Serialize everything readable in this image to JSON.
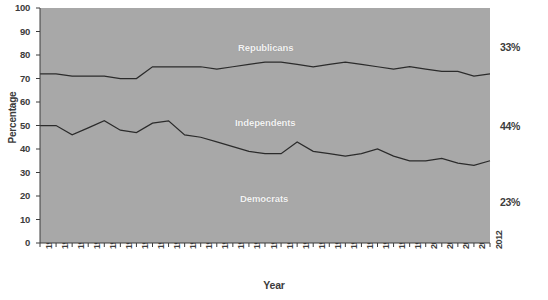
{
  "chart_data": {
    "type": "area",
    "title": "",
    "xlabel": "Year",
    "ylabel": "Percentage",
    "ylim": [
      0,
      100
    ],
    "yticks": [
      0,
      10,
      20,
      30,
      40,
      50,
      60,
      70,
      80,
      90,
      100
    ],
    "grid": false,
    "legend_position": "inline-bands",
    "stacked": true,
    "x": [
      1952,
      1954,
      1956,
      1958,
      1960,
      1962,
      1964,
      1966,
      1968,
      1970,
      1972,
      1974,
      1976,
      1978,
      1980,
      1982,
      1984,
      1986,
      1988,
      1990,
      1992,
      1994,
      1996,
      1998,
      2000,
      2002,
      2004,
      2008,
      2012
    ],
    "tick_labels": [
      "1952",
      "1954",
      "1956",
      "1958",
      "1960",
      "1962",
      "1964",
      "1966",
      "1968",
      "1970",
      "1972",
      "1974",
      "1976",
      "1978",
      "1980",
      "1982",
      "1984",
      "1986",
      "1988",
      "1990",
      "1992",
      "1994",
      "1996",
      "1998",
      "2000",
      "2002",
      "2004",
      "2008",
      "2012"
    ],
    "boundaries": {
      "democrats_top": {
        "name": "Democrats upper boundary (cumulative %)",
        "values": [
          50,
          50,
          46,
          49,
          52,
          48,
          47,
          51,
          52,
          46,
          45,
          43,
          41,
          39,
          38,
          38,
          43,
          39,
          38,
          37,
          38,
          40,
          37,
          35,
          35,
          36,
          34,
          33,
          35
        ]
      },
      "independents_top": {
        "name": "Democrats + Independents (cumulative %)",
        "values": [
          72,
          72,
          71,
          71,
          71,
          70,
          70,
          75,
          75,
          75,
          75,
          74,
          75,
          76,
          77,
          77,
          76,
          75,
          76,
          77,
          76,
          75,
          74,
          75,
          74,
          73,
          73,
          71,
          72
        ]
      }
    },
    "series": [
      {
        "name": "Democrats",
        "label": "Democrats",
        "color": "#a8a8a8",
        "end_value_label": "23%"
      },
      {
        "name": "Independents",
        "label": "Independents",
        "color": "#a8a8a8",
        "end_value_label": "44%"
      },
      {
        "name": "Republicans",
        "label": "Republicans",
        "color": "#a8a8a8",
        "end_value_label": "33%"
      }
    ],
    "band_labels": [
      {
        "text": "Republicans",
        "left": 238,
        "top": 42
      },
      {
        "text": "Independents",
        "left": 235,
        "top": 117
      },
      {
        "text": "Democrats",
        "left": 240,
        "top": 193
      }
    ],
    "right_annotations": [
      {
        "text": "33%",
        "top": 41
      },
      {
        "text": "44%",
        "top": 120
      },
      {
        "text": "23%",
        "top": 196
      }
    ],
    "colors": {
      "plot_fill": "#a8a8a8",
      "line": "#2b2b2b",
      "axis": "#3c3c3c",
      "band_label": "#f2f2f2",
      "page_background": "#ffffff"
    }
  }
}
